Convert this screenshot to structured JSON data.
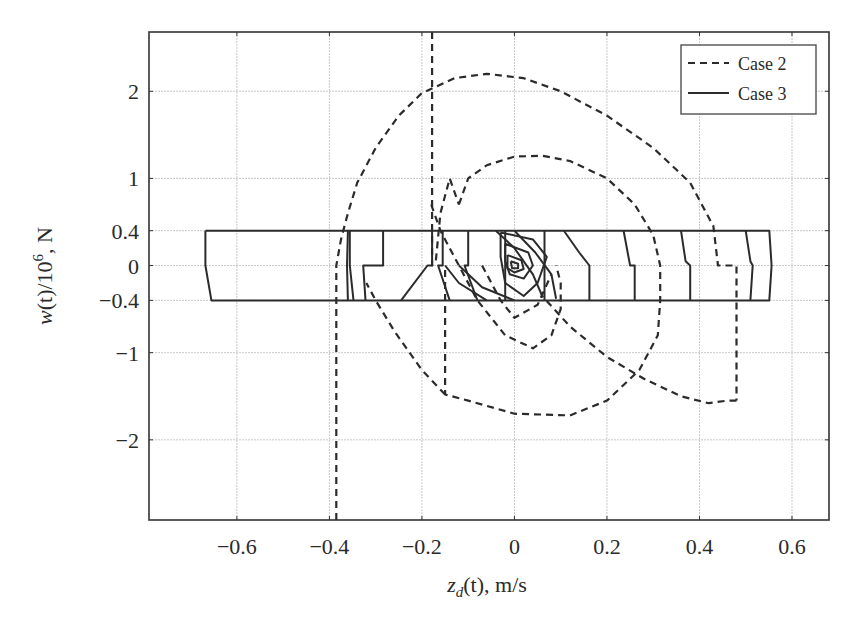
{
  "chart_data": {
    "type": "line",
    "title": "",
    "xlabel": "z_d(t), m/s",
    "ylabel": "w(t)/10^6, N",
    "xlim": [
      -0.79,
      0.68
    ],
    "ylim": [
      -2.92,
      2.68
    ],
    "grid": true,
    "legend_position": "upper right",
    "xticks": [
      -0.6,
      -0.4,
      -0.2,
      0,
      0.2,
      0.4,
      0.6
    ],
    "xtick_labels": [
      "−0.6",
      "−0.4",
      "−0.2",
      "0",
      "0.2",
      "0.4",
      "0.6"
    ],
    "yticks": [
      2,
      1,
      0.4,
      0,
      -0.4,
      -1,
      -2
    ],
    "ytick_labels": [
      "2",
      "1",
      "0.4",
      "0",
      "−0.4",
      "−1",
      "−2"
    ],
    "series": [
      {
        "name": "Case 2",
        "style": "dashed",
        "segments": [
          [
            [
              -0.385,
              -2.92
            ],
            [
              -0.385,
              -1.2
            ],
            [
              -0.385,
              0.0
            ],
            [
              -0.375,
              0.3
            ],
            [
              -0.36,
              0.6
            ],
            [
              -0.34,
              0.95
            ],
            [
              -0.3,
              1.35
            ],
            [
              -0.25,
              1.72
            ],
            [
              -0.2,
              1.98
            ],
            [
              -0.17,
              2.05
            ],
            [
              -0.13,
              2.15
            ],
            [
              -0.06,
              2.2
            ],
            [
              0.02,
              2.15
            ],
            [
              0.1,
              2.0
            ],
            [
              0.2,
              1.72
            ],
            [
              0.3,
              1.35
            ],
            [
              0.38,
              0.95
            ],
            [
              0.43,
              0.45
            ],
            [
              0.44,
              0.0
            ],
            [
              0.48,
              0.0
            ],
            [
              0.48,
              -1.55
            ]
          ],
          [
            [
              0.48,
              -1.55
            ],
            [
              0.46,
              -1.55
            ],
            [
              0.42,
              -1.58
            ],
            [
              0.36,
              -1.5
            ],
            [
              0.28,
              -1.3
            ],
            [
              0.2,
              -1.05
            ],
            [
              0.12,
              -0.7
            ],
            [
              0.06,
              -0.35
            ]
          ],
          [
            [
              -0.178,
              2.68
            ],
            [
              -0.178,
              1.0
            ],
            [
              -0.178,
              0.0
            ],
            [
              -0.17,
              0.05
            ],
            [
              -0.16,
              0.6
            ],
            [
              -0.14,
              1.0
            ],
            [
              -0.12,
              0.7
            ]
          ],
          [
            [
              -0.12,
              0.7
            ],
            [
              -0.1,
              1.0
            ],
            [
              -0.06,
              1.15
            ],
            [
              0.0,
              1.25
            ],
            [
              0.06,
              1.26
            ],
            [
              0.12,
              1.2
            ],
            [
              0.2,
              1.0
            ],
            [
              0.26,
              0.7
            ],
            [
              0.3,
              0.35
            ],
            [
              0.315,
              0.0
            ],
            [
              0.315,
              -0.4
            ],
            [
              0.31,
              -0.8
            ],
            [
              0.27,
              -1.2
            ],
            [
              0.2,
              -1.55
            ],
            [
              0.12,
              -1.72
            ],
            [
              0.0,
              -1.7
            ],
            [
              -0.1,
              -1.55
            ],
            [
              -0.15,
              -1.48
            ],
            [
              -0.15,
              -0.4
            ],
            [
              -0.15,
              0.0
            ]
          ],
          [
            [
              -0.15,
              -1.48
            ],
            [
              -0.2,
              -1.2
            ],
            [
              -0.26,
              -0.75
            ],
            [
              -0.3,
              -0.4
            ],
            [
              -0.32,
              -0.2
            ]
          ],
          [
            [
              -0.18,
              0.7
            ],
            [
              -0.16,
              0.4
            ],
            [
              -0.12,
              0.0
            ],
            [
              -0.08,
              -0.4
            ],
            [
              -0.02,
              -0.8
            ],
            [
              0.04,
              -0.95
            ],
            [
              0.08,
              -0.8
            ],
            [
              0.1,
              -0.5
            ],
            [
              0.1,
              -0.2
            ],
            [
              0.09,
              0.0
            ]
          ],
          [
            [
              -0.07,
              0.0
            ],
            [
              -0.03,
              -0.4
            ],
            [
              0.0,
              -0.6
            ],
            [
              0.05,
              -0.45
            ],
            [
              0.08,
              -0.1
            ]
          ]
        ]
      },
      {
        "name": "Case 3",
        "style": "solid",
        "segments": [
          [
            [
              -0.668,
              0.4
            ],
            [
              0.551,
              0.4
            ],
            [
              0.556,
              0.0
            ],
            [
              0.551,
              -0.4
            ],
            [
              -0.655,
              -0.4
            ],
            [
              -0.668,
              0.0
            ],
            [
              -0.668,
              0.4
            ]
          ],
          [
            [
              -0.36,
              0.4
            ],
            [
              -0.362,
              0.0
            ],
            [
              -0.36,
              -0.4
            ]
          ],
          [
            [
              -0.356,
              0.4
            ],
            [
              -0.356,
              0.0
            ],
            [
              -0.348,
              -0.4
            ]
          ],
          [
            [
              -0.284,
              0.4
            ],
            [
              -0.284,
              0.0
            ],
            [
              -0.327,
              0.0
            ],
            [
              -0.322,
              -0.4
            ]
          ],
          [
            [
              -0.178,
              0.4
            ],
            [
              -0.178,
              0.0
            ],
            [
              -0.188,
              0.0
            ],
            [
              -0.245,
              -0.4
            ]
          ],
          [
            [
              -0.155,
              0.4
            ],
            [
              -0.155,
              0.0
            ],
            [
              -0.165,
              0.0
            ],
            [
              -0.14,
              -0.4
            ]
          ],
          [
            [
              -0.1,
              0.4
            ],
            [
              -0.1,
              0.0
            ],
            [
              -0.108,
              0.0
            ],
            [
              -0.08,
              -0.4
            ]
          ],
          [
            [
              -0.02,
              0.4
            ],
            [
              -0.02,
              0.0
            ],
            [
              -0.02,
              -0.4
            ]
          ],
          [
            [
              0.065,
              0.4
            ],
            [
              0.065,
              0.0
            ],
            [
              0.065,
              -0.4
            ]
          ],
          [
            [
              0.107,
              0.4
            ],
            [
              0.14,
              0.15
            ],
            [
              0.162,
              0.0
            ],
            [
              0.162,
              -0.4
            ]
          ],
          [
            [
              0.236,
              0.4
            ],
            [
              0.25,
              0.0
            ],
            [
              0.26,
              0.0
            ],
            [
              0.26,
              -0.4
            ]
          ],
          [
            [
              0.36,
              0.4
            ],
            [
              0.37,
              0.05
            ],
            [
              0.38,
              0.0
            ],
            [
              0.38,
              -0.4
            ]
          ],
          [
            [
              0.5,
              0.4
            ],
            [
              0.51,
              0.05
            ],
            [
              0.515,
              0.0
            ],
            [
              0.51,
              -0.4
            ]
          ],
          [
            [
              -0.15,
              0.0
            ],
            [
              -0.12,
              -0.2
            ],
            [
              -0.06,
              -0.4
            ]
          ],
          [
            [
              -0.12,
              0.0
            ],
            [
              -0.07,
              -0.25
            ],
            [
              0.0,
              -0.4
            ]
          ],
          [
            [
              -0.04,
              0.4
            ],
            [
              0.0,
              0.2
            ],
            [
              0.04,
              -0.1
            ],
            [
              0.06,
              -0.35
            ]
          ],
          [
            [
              -0.03,
              0.38
            ],
            [
              0.04,
              0.3
            ],
            [
              0.07,
              0.1
            ],
            [
              0.05,
              -0.2
            ],
            [
              0.02,
              -0.35
            ],
            [
              -0.02,
              -0.2
            ],
            [
              -0.03,
              0.1
            ],
            [
              -0.03,
              0.38
            ]
          ],
          [
            [
              -0.02,
              0.25
            ],
            [
              0.03,
              0.15
            ],
            [
              0.04,
              0.0
            ],
            [
              0.02,
              -0.15
            ],
            [
              -0.01,
              -0.1
            ],
            [
              -0.02,
              0.05
            ],
            [
              -0.02,
              0.25
            ]
          ],
          [
            [
              -0.015,
              0.12
            ],
            [
              0.015,
              0.06
            ],
            [
              0.02,
              -0.04
            ],
            [
              0.0,
              -0.08
            ],
            [
              -0.015,
              -0.03
            ],
            [
              -0.015,
              0.12
            ]
          ],
          [
            [
              -0.008,
              0.05
            ],
            [
              0.008,
              0.02
            ],
            [
              0.008,
              -0.03
            ],
            [
              -0.005,
              -0.03
            ],
            [
              -0.008,
              0.05
            ]
          ],
          [
            [
              0.0,
              0.4
            ],
            [
              0.045,
              0.15
            ],
            [
              0.08,
              -0.1
            ],
            [
              0.09,
              -0.38
            ]
          ]
        ]
      }
    ]
  },
  "legend": {
    "items": [
      {
        "label": "Case 2",
        "style": "dashed"
      },
      {
        "label": "Case 3",
        "style": "solid"
      }
    ]
  },
  "axes": {
    "xlabel_main": "z",
    "xlabel_sub": "d",
    "xlabel_rest": "(t), m/s",
    "ylabel_main": "w",
    "ylabel_mid": "(t)/10",
    "ylabel_sup": "6",
    "ylabel_rest": ", N"
  }
}
